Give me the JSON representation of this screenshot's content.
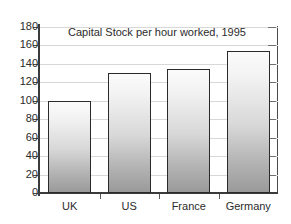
{
  "chart_data": {
    "type": "bar",
    "title": "Capital Stock per hour worked, 1995",
    "categories": [
      "UK",
      "US",
      "France",
      "Germany"
    ],
    "values": [
      100,
      130,
      135,
      154
    ],
    "xlabel": "",
    "ylabel": "",
    "ylim": [
      0,
      180
    ],
    "yticks": [
      0,
      20,
      40,
      60,
      80,
      100,
      120,
      140,
      160,
      180
    ],
    "ytick_labels": [
      "0",
      "20",
      "40",
      "60",
      "80",
      "100",
      "120",
      "140",
      "160",
      "180"
    ],
    "grid": true,
    "legend": null,
    "colors": {
      "bar_top": "#fbfbfb",
      "bar_bottom": "#9a9a9a",
      "bar_outline": "#2a2a2a",
      "gridline": "#d8d8d8",
      "axis": "#3b3b3b",
      "background": "#ffffff",
      "text": "#2b2b2b"
    }
  }
}
